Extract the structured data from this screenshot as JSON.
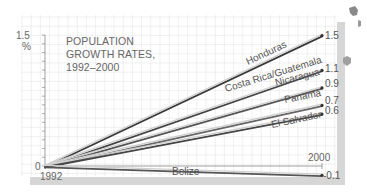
{
  "chart_data": {
    "type": "line",
    "title": "POPULATION GROWTH RATES, 1992–2000",
    "title_lines": [
      "POPULATION",
      "GROWTH RATES,",
      "1992–2000"
    ],
    "xlabel": "",
    "ylabel": "%",
    "x": [
      1992,
      2000
    ],
    "x_tick_labels": [
      "1992",
      "2000"
    ],
    "y_tick_labels": [
      "0",
      "1.5"
    ],
    "y_unit_label": "%",
    "ylim": [
      -0.1,
      1.5
    ],
    "grid": true,
    "legend": "inline labels along lines",
    "series": [
      {
        "name": "Honduras",
        "values": [
          0,
          1.5
        ],
        "end_label": "1.5",
        "color": "#3a3a3a"
      },
      {
        "name": "Costa Rica/Guatemala",
        "values": [
          0,
          1.1
        ],
        "end_label": "1.1",
        "color": "#444444"
      },
      {
        "name": "Nicaragua",
        "values": [
          0,
          0.9
        ],
        "end_label": "0.9",
        "color": "#555555"
      },
      {
        "name": "Panama",
        "values": [
          0,
          0.7
        ],
        "end_label": "0.7",
        "color": "#666666"
      },
      {
        "name": "El Salvador",
        "values": [
          0,
          0.6
        ],
        "end_label": "0.6",
        "color": "#444444"
      },
      {
        "name": "Belize",
        "values": [
          0,
          -0.1
        ],
        "end_label": "-0.1",
        "color": "#555555"
      }
    ]
  },
  "colors": {
    "grid": "#e6e6e6",
    "panel_bg": "#ffffff",
    "shadow": "#d4d4d4",
    "axis": "#888888",
    "text": "#666666"
  }
}
